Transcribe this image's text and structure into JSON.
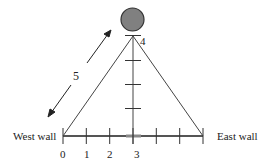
{
  "diagram": {
    "labels": {
      "west_wall": "West wall",
      "east_wall": "East wall",
      "hypotenuse_length": "5",
      "height_value": "4"
    },
    "axis_ticks": [
      "0",
      "1",
      "2",
      "3"
    ],
    "colors": {
      "line": "#333333",
      "ball_fill": "#808080",
      "ball_stroke": "#333333",
      "floor_line": "#555555"
    }
  }
}
